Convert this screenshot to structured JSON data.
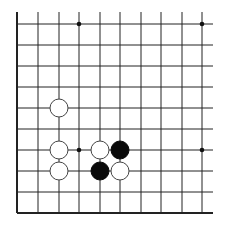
{
  "board": {
    "columns_x": [
      17,
      38,
      59,
      79,
      100,
      120,
      141,
      161,
      182,
      202
    ],
    "rows_y": [
      24,
      45,
      66,
      87,
      108,
      129,
      150,
      171,
      192,
      213
    ],
    "left_edge": true,
    "bottom_edge": true,
    "line_extend_right": 213,
    "line_extend_top": 12,
    "line_color": "#222222",
    "stone_radius": 9,
    "star_points": [
      {
        "col": 3,
        "row": 0
      },
      {
        "col": 9,
        "row": 0
      },
      {
        "col": 3,
        "row": 6
      },
      {
        "col": 9,
        "row": 6
      }
    ],
    "stones": [
      {
        "color": "white",
        "col": 2,
        "row": 4
      },
      {
        "color": "white",
        "col": 2,
        "row": 6
      },
      {
        "color": "white",
        "col": 2,
        "row": 7
      },
      {
        "color": "white",
        "col": 4,
        "row": 6
      },
      {
        "color": "black",
        "col": 5,
        "row": 6
      },
      {
        "color": "black",
        "col": 4,
        "row": 7
      },
      {
        "color": "white",
        "col": 5,
        "row": 7
      }
    ]
  }
}
